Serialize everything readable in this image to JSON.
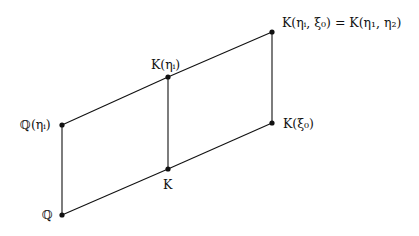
{
  "diagram": {
    "type": "field-extension-lattice",
    "nodes": [
      {
        "id": "Q",
        "label": "ℚ",
        "x": 62,
        "y": 215,
        "label_x": 42,
        "label_y": 219
      },
      {
        "id": "Q_eta",
        "label": "ℚ(ηᵢ)",
        "x": 62,
        "y": 125,
        "label_x": 20,
        "label_y": 129
      },
      {
        "id": "K",
        "label": "K",
        "x": 168,
        "y": 169,
        "label_x": 163,
        "label_y": 189
      },
      {
        "id": "K_eta",
        "label": "K(ηᵢ)",
        "x": 168,
        "y": 77,
        "label_x": 151,
        "label_y": 69
      },
      {
        "id": "K_xi",
        "label": "K(ξ₀)",
        "x": 272,
        "y": 123,
        "label_x": 283,
        "label_y": 128
      },
      {
        "id": "K_eta_xi",
        "label": "K(ηᵢ, ξ₀) = K(η₁, η₂)",
        "x": 272,
        "y": 32,
        "label_x": 282,
        "label_y": 27
      }
    ],
    "edges": [
      {
        "from": "Q",
        "to": "K"
      },
      {
        "from": "K",
        "to": "K_xi"
      },
      {
        "from": "Q_eta",
        "to": "K_eta"
      },
      {
        "from": "K_eta",
        "to": "K_eta_xi"
      },
      {
        "from": "Q",
        "to": "Q_eta"
      },
      {
        "from": "K",
        "to": "K_eta"
      },
      {
        "from": "K_xi",
        "to": "K_eta_xi"
      }
    ]
  }
}
